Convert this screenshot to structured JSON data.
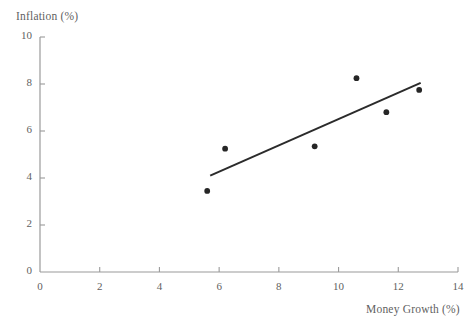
{
  "chart_data": {
    "type": "scatter",
    "title": "",
    "xlabel": "Money Growth (%)",
    "ylabel": "Inflation (%)",
    "xlim": [
      0,
      14
    ],
    "ylim": [
      0,
      10
    ],
    "xticks": [
      "0",
      "2",
      "4",
      "6",
      "8",
      "10",
      "12",
      "14"
    ],
    "xtick_values": [
      0,
      2,
      4,
      6,
      8,
      10,
      12,
      14
    ],
    "yticks": [
      "0",
      "2",
      "4",
      "6",
      "8",
      "10"
    ],
    "ytick_values": [
      0,
      2,
      4,
      6,
      8,
      10
    ],
    "grid": false,
    "legend": null,
    "series": [
      {
        "name": "Observations",
        "type": "scatter",
        "marker_color": "#262626",
        "marker_size": 5,
        "x": [
          5.6,
          6.2,
          9.2,
          10.6,
          11.6,
          12.7
        ],
        "y": [
          3.45,
          5.25,
          5.35,
          8.25,
          6.8,
          7.75
        ],
        "points": [
          {
            "x": 5.6,
            "y": 3.45
          },
          {
            "x": 6.2,
            "y": 5.25
          },
          {
            "x": 9.2,
            "y": 5.35
          },
          {
            "x": 10.6,
            "y": 8.25
          },
          {
            "x": 11.6,
            "y": 6.8
          },
          {
            "x": 12.7,
            "y": 7.75
          }
        ]
      },
      {
        "name": "Fitted trend line",
        "type": "line",
        "line_color": "#2b2b2b",
        "line_width": 2,
        "x": [
          5.7,
          12.75
        ],
        "y": [
          4.1,
          8.05
        ]
      }
    ],
    "axis_color": "#9a9a9a",
    "background_color": "#ffffff"
  },
  "labels": {
    "y_axis_title": "Inflation (%)",
    "x_axis_title": "Money Growth (%)"
  }
}
